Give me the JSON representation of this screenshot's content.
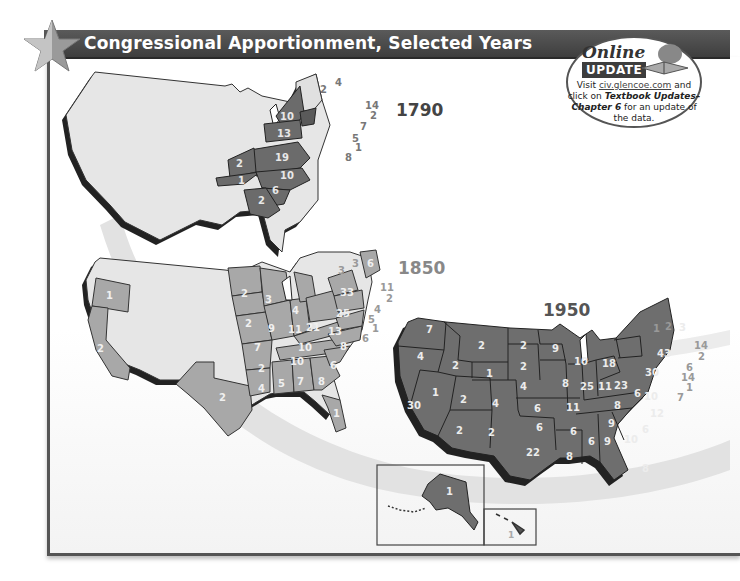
{
  "header": {
    "title": "Congressional Apportionment, Selected Years",
    "icon": "star-icon"
  },
  "online_update": {
    "heading_online": "Online",
    "heading_update": "UPDATE",
    "icon": "book-icon",
    "text_prefix": "Visit ",
    "link_text": "civ.glencoe.com",
    "text_mid": " and click on ",
    "bold_text": "Textbook Updates–Chapter 6",
    "text_suffix": " for an update of the data."
  },
  "maps": [
    {
      "year": "1790",
      "state_color": "#6b6b6b",
      "label_color": "#e8e8e8",
      "labels": [
        {
          "state": "NY",
          "value": "10"
        },
        {
          "state": "PA",
          "value": "13"
        },
        {
          "state": "VA",
          "value": "19"
        },
        {
          "state": "KY",
          "value": "2"
        },
        {
          "state": "TN",
          "value": "1"
        },
        {
          "state": "NC",
          "value": "10"
        },
        {
          "state": "SC",
          "value": "6"
        },
        {
          "state": "GA",
          "value": "2"
        }
      ],
      "callouts": [
        {
          "state": "VT",
          "value": "2"
        },
        {
          "state": "NH",
          "value": "4"
        },
        {
          "state": "MA",
          "value": "14"
        },
        {
          "state": "RI",
          "value": "2"
        },
        {
          "state": "CT",
          "value": "7"
        },
        {
          "state": "NJ",
          "value": "5"
        },
        {
          "state": "DE",
          "value": "1"
        },
        {
          "state": "MD",
          "value": "8"
        }
      ]
    },
    {
      "year": "1850",
      "state_color": "#a8a8a8",
      "label_color": "#f0f0f0",
      "labels": [
        {
          "state": "OR",
          "value": "1"
        },
        {
          "state": "CA",
          "value": "2"
        },
        {
          "state": "TX",
          "value": "2"
        },
        {
          "state": "MN",
          "value": "2"
        },
        {
          "state": "WI",
          "value": "3"
        },
        {
          "state": "IA",
          "value": "2"
        },
        {
          "state": "MI",
          "value": "4"
        },
        {
          "state": "IL",
          "value": "9"
        },
        {
          "state": "IN",
          "value": "11"
        },
        {
          "state": "OH",
          "value": "21"
        },
        {
          "state": "MO",
          "value": "7"
        },
        {
          "state": "KY",
          "value": "10"
        },
        {
          "state": "TN",
          "value": "10"
        },
        {
          "state": "AR",
          "value": "2"
        },
        {
          "state": "LA",
          "value": "4"
        },
        {
          "state": "MS",
          "value": "5"
        },
        {
          "state": "AL",
          "value": "7"
        },
        {
          "state": "GA",
          "value": "8"
        },
        {
          "state": "SC",
          "value": "6"
        },
        {
          "state": "NC",
          "value": "8"
        },
        {
          "state": "VA",
          "value": "13"
        },
        {
          "state": "FL",
          "value": "1"
        },
        {
          "state": "NY",
          "value": "33"
        },
        {
          "state": "PA",
          "value": "25"
        },
        {
          "state": "ME",
          "value": "6"
        }
      ],
      "callouts": [
        {
          "state": "VT",
          "value": "3"
        },
        {
          "state": "NH",
          "value": "3"
        },
        {
          "state": "MA",
          "value": "11"
        },
        {
          "state": "RI",
          "value": "2"
        },
        {
          "state": "CT",
          "value": "4"
        },
        {
          "state": "NJ",
          "value": "5"
        },
        {
          "state": "DE",
          "value": "1"
        },
        {
          "state": "MD",
          "value": "6"
        }
      ]
    },
    {
      "year": "1950",
      "state_color": "#6e6e6e",
      "label_color": "#ececec",
      "labels": [
        {
          "state": "WA",
          "value": "7"
        },
        {
          "state": "OR",
          "value": "4"
        },
        {
          "state": "CA",
          "value": "30"
        },
        {
          "state": "NV",
          "value": "1"
        },
        {
          "state": "ID",
          "value": "2"
        },
        {
          "state": "MT",
          "value": "2"
        },
        {
          "state": "WY",
          "value": "1"
        },
        {
          "state": "UT",
          "value": "2"
        },
        {
          "state": "CO",
          "value": "4"
        },
        {
          "state": "AZ",
          "value": "2"
        },
        {
          "state": "NM",
          "value": "2"
        },
        {
          "state": "ND",
          "value": "2"
        },
        {
          "state": "SD",
          "value": "2"
        },
        {
          "state": "NE",
          "value": "4"
        },
        {
          "state": "KS",
          "value": "6"
        },
        {
          "state": "OK",
          "value": "6"
        },
        {
          "state": "TX",
          "value": "22"
        },
        {
          "state": "MN",
          "value": "9"
        },
        {
          "state": "IA",
          "value": "8"
        },
        {
          "state": "MO",
          "value": "11"
        },
        {
          "state": "AR",
          "value": "6"
        },
        {
          "state": "LA",
          "value": "8"
        },
        {
          "state": "WI",
          "value": "10"
        },
        {
          "state": "IL",
          "value": "25"
        },
        {
          "state": "MI",
          "value": "18"
        },
        {
          "state": "IN",
          "value": "11"
        },
        {
          "state": "OH",
          "value": "23"
        },
        {
          "state": "KY",
          "value": "8"
        },
        {
          "state": "TN",
          "value": "9"
        },
        {
          "state": "MS",
          "value": "6"
        },
        {
          "state": "AL",
          "value": "9"
        },
        {
          "state": "GA",
          "value": "10"
        },
        {
          "state": "FL",
          "value": "8"
        },
        {
          "state": "SC",
          "value": "6"
        },
        {
          "state": "NC",
          "value": "12"
        },
        {
          "state": "VA",
          "value": "10"
        },
        {
          "state": "WV",
          "value": "6"
        },
        {
          "state": "PA",
          "value": "30"
        },
        {
          "state": "NY",
          "value": "43"
        },
        {
          "state": "ME",
          "value": "3"
        },
        {
          "state": "AK",
          "value": "1"
        },
        {
          "state": "HI",
          "value": "1"
        }
      ],
      "callouts": [
        {
          "state": "VT",
          "value": "1"
        },
        {
          "state": "NH",
          "value": "2"
        },
        {
          "state": "MA",
          "value": "14"
        },
        {
          "state": "RI",
          "value": "2"
        },
        {
          "state": "CT",
          "value": "6"
        },
        {
          "state": "NJ",
          "value": "14"
        },
        {
          "state": "DE",
          "value": "1"
        },
        {
          "state": "MD",
          "value": "7"
        }
      ]
    }
  ]
}
